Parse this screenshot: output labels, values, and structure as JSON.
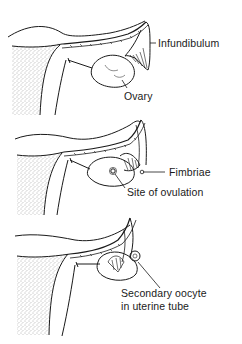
{
  "diagram": {
    "panels": [
      {
        "id": "panel-1",
        "labels": [
          {
            "key": "infundibulum",
            "text": "Infundibulum"
          },
          {
            "key": "ovary",
            "text": "Ovary"
          }
        ]
      },
      {
        "id": "panel-2",
        "labels": [
          {
            "key": "fimbriae",
            "text": "Fimbriae"
          },
          {
            "key": "site_of_ovulation",
            "text": "Site of ovulation"
          }
        ]
      },
      {
        "id": "panel-3",
        "labels": [
          {
            "key": "secondary_oocyte_line1",
            "text": "Secondary oocyte"
          },
          {
            "key": "secondary_oocyte_line2",
            "text": "in uterine tube"
          }
        ]
      }
    ],
    "colors": {
      "line": "#1a1a1a",
      "stipple": "#555555",
      "background": "#ffffff"
    }
  }
}
